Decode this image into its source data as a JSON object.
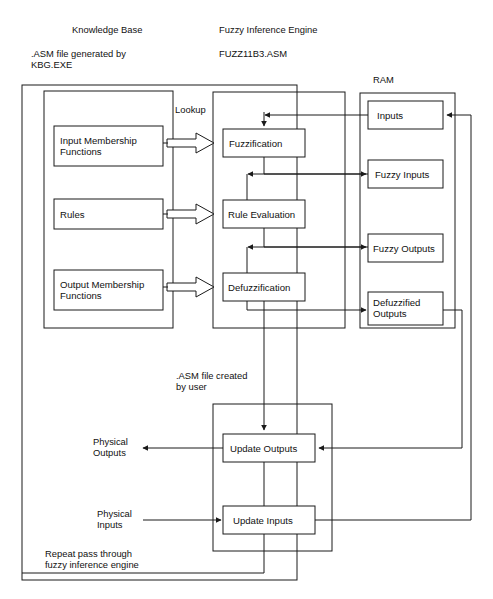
{
  "diagram": {
    "background": "#ffffff",
    "line_color": "#1a1a1a",
    "text_color": "#111111",
    "captions": {
      "knowledge_base_title": "Knowledge Base",
      "knowledge_base_sub_line1": ".ASM file generated by",
      "knowledge_base_sub_line2": "KBG.EXE",
      "engine_title": "Fuzzy Inference Engine",
      "engine_file": "FUZZ11B3.ASM",
      "ram_title": "RAM",
      "lookup": "Lookup",
      "user_file_line1": ".ASM file created",
      "user_file_line2": "by user",
      "physical_outputs_line1": "Physical",
      "physical_outputs_line2": "Outputs",
      "physical_inputs_line1": "Physical",
      "physical_inputs_line2": "Inputs",
      "repeat_line1": "Repeat pass through",
      "repeat_line2": "fuzzy inference engine"
    },
    "knowledge_base_boxes": [
      {
        "id": "input-membership-functions",
        "line1": "Input Membership",
        "line2": "Functions"
      },
      {
        "id": "rules",
        "line1": "Rules",
        "line2": ""
      },
      {
        "id": "output-membership-functions",
        "line1": "Output Membership",
        "line2": "Functions"
      }
    ],
    "engine_boxes": [
      {
        "id": "fuzzification",
        "label": "Fuzzification"
      },
      {
        "id": "rule-evaluation",
        "label": "Rule Evaluation"
      },
      {
        "id": "defuzzification",
        "label": "Defuzzification"
      }
    ],
    "ram_boxes": [
      {
        "id": "inputs",
        "line1": "Inputs",
        "line2": ""
      },
      {
        "id": "fuzzy-inputs",
        "line1": "Fuzzy Inputs",
        "line2": ""
      },
      {
        "id": "fuzzy-outputs",
        "line1": "Fuzzy Outputs",
        "line2": ""
      },
      {
        "id": "defuzzified-outputs",
        "line1": "Defuzzified",
        "line2": "Outputs"
      }
    ],
    "user_boxes": [
      {
        "id": "update-outputs",
        "label": "Update Outputs"
      },
      {
        "id": "update-inputs",
        "label": "Update Inputs"
      }
    ]
  }
}
